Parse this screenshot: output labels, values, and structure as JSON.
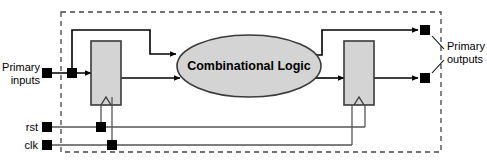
{
  "diagram": {
    "boundary": {
      "name": "circuit-boundary",
      "style": "dashed",
      "color": "#444444",
      "x": 61,
      "y": 12,
      "width": 380,
      "height": 140
    },
    "blocks": [
      {
        "id": "input-register",
        "label": "",
        "kind": "register",
        "fill": "#d4d4d4",
        "stroke": "#3a3a3a",
        "x": 91,
        "y": 41,
        "width": 30,
        "height": 64
      },
      {
        "id": "combinational-logic",
        "label": "Combinational Logic",
        "kind": "ellipse",
        "fill": "#d4d4d4",
        "stroke": "#3a3a3a",
        "cx": 249,
        "cy": 66,
        "rx": 72,
        "ry": 31
      },
      {
        "id": "output-register",
        "label": "",
        "kind": "register",
        "fill": "#d4d4d4",
        "stroke": "#3a3a3a",
        "x": 344,
        "y": 41,
        "width": 30,
        "height": 64
      }
    ],
    "terminals": [
      {
        "id": "primary-input-terminal",
        "x": 47,
        "y": 73
      },
      {
        "id": "primary-input-tap",
        "x": 72,
        "y": 73
      },
      {
        "id": "rst-terminal",
        "x": 47,
        "y": 127
      },
      {
        "id": "rst-tap",
        "x": 101,
        "y": 127
      },
      {
        "id": "clk-terminal",
        "x": 47,
        "y": 145
      },
      {
        "id": "clk-tap",
        "x": 112,
        "y": 145
      },
      {
        "id": "primary-output-terminal-top",
        "x": 425,
        "y": 30
      },
      {
        "id": "primary-output-terminal-bottom",
        "x": 425,
        "y": 100
      }
    ],
    "labels": [
      {
        "id": "primary-inputs-label",
        "line1": "Primary",
        "line2": "inputs",
        "x": 42,
        "y": 70,
        "anchor": "end"
      },
      {
        "id": "primary-outputs-label",
        "line1": "Primary",
        "line2": "outputs",
        "x": 443,
        "y": 56,
        "anchor": "start"
      },
      {
        "id": "rst-label",
        "text": "rst",
        "x": 40,
        "y": 131,
        "anchor": "end"
      },
      {
        "id": "clk-label",
        "text": "clk",
        "x": 40,
        "y": 149,
        "anchor": "end"
      }
    ],
    "signals": {
      "reset": "rst",
      "clock": "clk",
      "combinational_block": "Combinational Logic",
      "primary_inputs": "Primary inputs",
      "primary_outputs": "Primary outputs"
    },
    "colors": {
      "wire": "#000000",
      "block_fill": "#d4d4d4",
      "block_stroke": "#3a3a3a",
      "boundary": "#444444",
      "control_wire": "#555555",
      "background": "#ffffff"
    }
  }
}
